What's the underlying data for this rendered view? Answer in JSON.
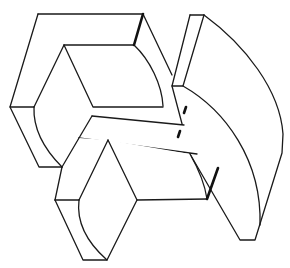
{
  "figure": {
    "type": "isometric-line-drawing",
    "stroke_color": "#1a1a1a",
    "background": "#ffffff",
    "parts": [
      {
        "name": "upper-left-block",
        "label": ""
      },
      {
        "name": "right-quarter-cylinder-slab",
        "label": ""
      },
      {
        "name": "middle-bar",
        "label": ""
      },
      {
        "name": "lower-block",
        "label": ""
      }
    ],
    "hidden_edge_marks": 2
  }
}
